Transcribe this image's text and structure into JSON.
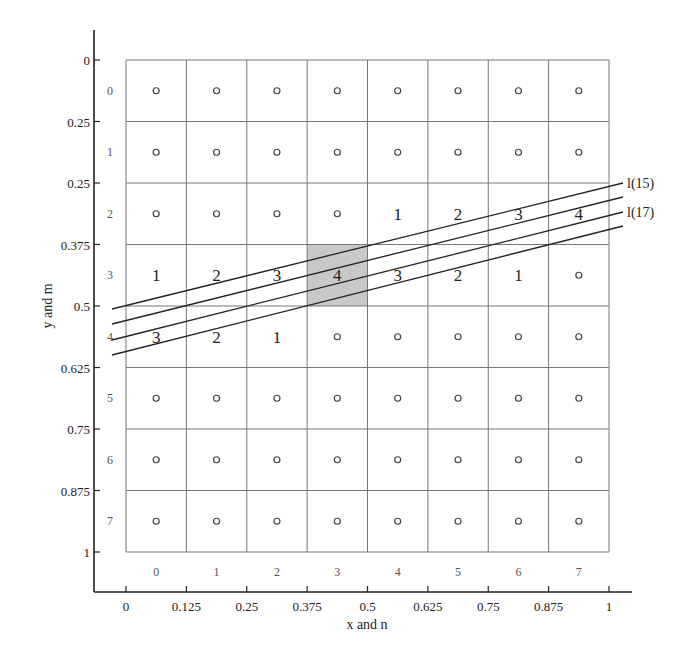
{
  "chart_data": {
    "type": "diagram",
    "title": "",
    "xlabel": "x and n",
    "ylabel": "y and m",
    "x_ticks": [
      "0",
      "0.125",
      "0.25",
      "0.375",
      "0.5",
      "0.625",
      "0.75",
      "0.875",
      "1"
    ],
    "y_ticks": [
      "0",
      "0.25",
      "0.25",
      "0.375",
      "0.5",
      "0.625",
      "0.75",
      "0.875",
      "1"
    ],
    "n_index_labels": [
      "0",
      "1",
      "2",
      "3",
      "4",
      "5",
      "6",
      "7"
    ],
    "m_index_labels": [
      "0",
      "1",
      "2",
      "3",
      "4",
      "5",
      "6",
      "7"
    ],
    "grid": {
      "rows": 8,
      "cols": 8,
      "default_marker": "o"
    },
    "shaded_cell": {
      "row": 3,
      "col": 3,
      "label": "4",
      "color": "#c8c8c8"
    },
    "cell_numbers": [
      {
        "row": 2,
        "col": 4,
        "label": "1"
      },
      {
        "row": 2,
        "col": 5,
        "label": "2"
      },
      {
        "row": 2,
        "col": 6,
        "label": "3"
      },
      {
        "row": 2,
        "col": 7,
        "label": "4"
      },
      {
        "row": 3,
        "col": 0,
        "label": "1"
      },
      {
        "row": 3,
        "col": 1,
        "label": "2"
      },
      {
        "row": 3,
        "col": 2,
        "label": "3"
      },
      {
        "row": 3,
        "col": 4,
        "label": "3"
      },
      {
        "row": 3,
        "col": 5,
        "label": "2"
      },
      {
        "row": 3,
        "col": 6,
        "label": "1"
      },
      {
        "row": 4,
        "col": 0,
        "label": "3"
      },
      {
        "row": 4,
        "col": 1,
        "label": "2"
      },
      {
        "row": 4,
        "col": 2,
        "label": "1"
      }
    ],
    "lines": [
      {
        "label": "l(15)",
        "x0": 112,
        "y0": 309,
        "x1": 623,
        "y1": 183
      },
      {
        "label": "",
        "x0": 112,
        "y0": 324,
        "x1": 623,
        "y1": 197
      },
      {
        "label": "l(17)",
        "x0": 112,
        "y0": 340,
        "x1": 623,
        "y1": 212
      },
      {
        "label": "",
        "x0": 112,
        "y0": 355,
        "x1": 623,
        "y1": 226
      }
    ]
  }
}
